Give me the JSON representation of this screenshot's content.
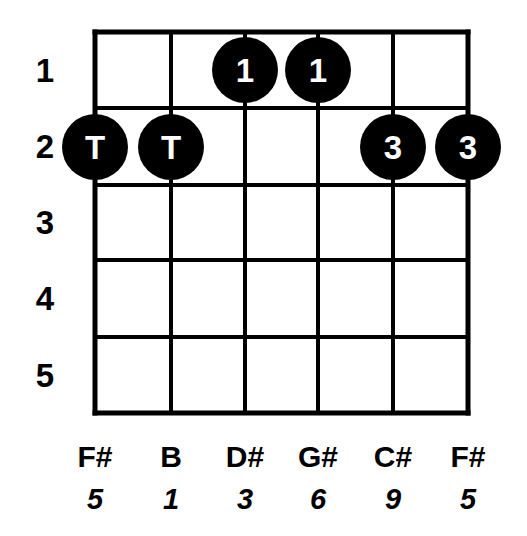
{
  "diagram": {
    "type": "guitar-chord-diagram",
    "instrument": "guitar",
    "string_count": 6,
    "fret_count": 5,
    "colors": {
      "background": "#ffffff",
      "grid": "#000000",
      "dot_fill": "#000000",
      "dot_text": "#ffffff"
    },
    "geometry": {
      "string_x": [
        95,
        171,
        245,
        318,
        393,
        468
      ],
      "fret_y": [
        32,
        108,
        185,
        260,
        337,
        413
      ],
      "dot_radius": 33,
      "grid_line_width": 4,
      "outer_line_width": 5
    },
    "fret_numbers": [
      {
        "label": "1",
        "x": 45,
        "y": 70
      },
      {
        "label": "2",
        "x": 45,
        "y": 146
      },
      {
        "label": "3",
        "x": 45,
        "y": 222
      },
      {
        "label": "4",
        "x": 45,
        "y": 298
      },
      {
        "label": "5",
        "x": 45,
        "y": 375
      }
    ],
    "strings": [
      {
        "index": 1,
        "note": "F#",
        "interval": "5",
        "x": 95
      },
      {
        "index": 2,
        "note": "B",
        "interval": "1",
        "x": 171
      },
      {
        "index": 3,
        "note": "D#",
        "interval": "3",
        "x": 245
      },
      {
        "index": 4,
        "note": "G#",
        "interval": "6",
        "x": 318
      },
      {
        "index": 5,
        "note": "C#",
        "interval": "9",
        "x": 393
      },
      {
        "index": 6,
        "note": "F#",
        "interval": "5",
        "x": 468
      }
    ],
    "note_row_y": 442,
    "interval_row_y": 485,
    "dots": [
      {
        "label": "1",
        "string": 3,
        "fret": 1,
        "cx": 245,
        "cy": 70
      },
      {
        "label": "1",
        "string": 4,
        "fret": 1,
        "cx": 318,
        "cy": 70
      },
      {
        "label": "T",
        "string": 1,
        "fret": 2,
        "cx": 95,
        "cy": 147
      },
      {
        "label": "T",
        "string": 2,
        "fret": 2,
        "cx": 171,
        "cy": 147
      },
      {
        "label": "3",
        "string": 5,
        "fret": 2,
        "cx": 393,
        "cy": 147
      },
      {
        "label": "3",
        "string": 6,
        "fret": 2,
        "cx": 468,
        "cy": 147
      }
    ]
  }
}
